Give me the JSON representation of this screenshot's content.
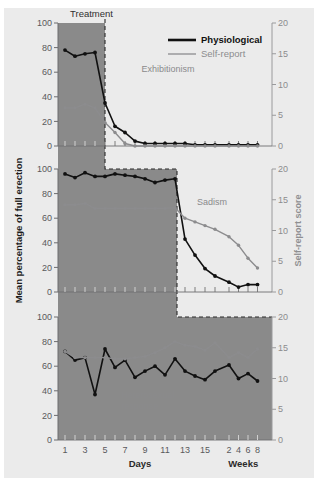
{
  "figure": {
    "background_color": "#ffffff",
    "panel_background_color": "#ebebeb",
    "shading_color": "#8a8a8a",
    "series_colors": {
      "physiological": "#111111",
      "self_report": "#8c8c8e"
    }
  },
  "axes": {
    "left_title": "Mean percentage of full erection",
    "right_title": "Self-report score",
    "x_title_days": "Days",
    "x_title_weeks": "Weeks",
    "left_ticks": [
      "0",
      "20",
      "40",
      "60",
      "80",
      "100"
    ],
    "right_ticks": [
      "0",
      "5",
      "10",
      "15",
      "20"
    ],
    "x_day_ticks": [
      "1",
      "3",
      "5",
      "7",
      "9",
      "11",
      "13",
      "15"
    ],
    "x_week_ticks": [
      "2",
      "4",
      "6",
      "8"
    ],
    "left_range": [
      0,
      100
    ],
    "right_range": [
      0,
      20
    ]
  },
  "legend": {
    "position": "top-right",
    "entries": [
      {
        "label": "Physiological",
        "color": "#111111",
        "style": "thick-solid"
      },
      {
        "label": "Self-report",
        "color": "#8c8c8e",
        "style": "thin-solid"
      }
    ]
  },
  "phase": {
    "treatment_label": "Treatment"
  },
  "panels": [
    {
      "annotation": "Exhibitionism"
    },
    {
      "annotation": "Sadism"
    },
    {
      "annotation": "Heterosexual response"
    }
  ],
  "chart_data": [
    {
      "type": "line",
      "title": "Exhibitionism",
      "xlabel": "Days / Weeks",
      "ylabel": "Mean percentage of full erection",
      "ylabel_right": "Self-report score",
      "ylim": [
        0,
        100
      ],
      "ylim_right": [
        0,
        20
      ],
      "grid": false,
      "legend": [
        "Physiological",
        "Self-report"
      ],
      "treatment_shading_x": [
        1,
        5
      ],
      "x": [
        1,
        2,
        3,
        4,
        5,
        6,
        7,
        8,
        9,
        10,
        11,
        12,
        13,
        14,
        15,
        16,
        "w2",
        "w4",
        "w6",
        "w8"
      ],
      "series": [
        {
          "name": "Physiological",
          "axis": "left",
          "values": [
            78,
            73,
            75,
            76,
            35,
            16,
            11,
            4,
            2,
            2,
            2,
            2,
            2,
            1,
            1,
            1,
            1,
            1,
            1,
            1
          ]
        },
        {
          "name": "Self-report",
          "axis": "right",
          "values": [
            6.2,
            6.2,
            6.8,
            6.2,
            3.8,
            2.2,
            0.4,
            0,
            0,
            0,
            0,
            0,
            0,
            0,
            0,
            0,
            0,
            0,
            0,
            0
          ]
        }
      ]
    },
    {
      "type": "line",
      "title": "Sadism",
      "xlabel": "Days / Weeks",
      "ylabel": "Mean percentage of full erection",
      "ylabel_right": "Self-report score",
      "ylim": [
        0,
        100
      ],
      "ylim_right": [
        0,
        20
      ],
      "grid": false,
      "legend": [
        "Physiological",
        "Self-report"
      ],
      "treatment_shading_x": [
        1,
        11
      ],
      "x": [
        1,
        2,
        3,
        4,
        5,
        6,
        7,
        8,
        9,
        10,
        11,
        12,
        13,
        14,
        15,
        16,
        "w2",
        "w4",
        "w6",
        "w8"
      ],
      "series": [
        {
          "name": "Physiological",
          "axis": "left",
          "values": [
            96,
            93,
            97,
            94,
            94,
            96,
            95,
            94,
            92,
            89,
            91,
            92,
            43,
            30,
            19,
            13,
            8,
            4,
            6,
            6
          ],
          "note": "post-treatment from day 13 onward declines; weeks values 6,6,4,2"
        },
        {
          "name": "Self-report",
          "axis": "right",
          "values": [
            14.2,
            14.2,
            14.4,
            13.6,
            13.6,
            13.6,
            13.6,
            13.6,
            13.6,
            13.6,
            13.6,
            13.7,
            12.0,
            11.4,
            10.8,
            10.2,
            9.0,
            7.6,
            5.5,
            3.9
          ]
        }
      ]
    },
    {
      "type": "line",
      "title": "Heterosexual response",
      "xlabel": "Days / Weeks",
      "ylabel": "Mean percentage of full erection",
      "ylabel_right": "Self-report score",
      "ylim": [
        0,
        100
      ],
      "ylim_right": [
        0,
        20
      ],
      "grid": false,
      "legend": [
        "Physiological",
        "Self-report"
      ],
      "treatment_shading_x": [
        1,
        "w8"
      ],
      "x": [
        1,
        2,
        3,
        4,
        5,
        6,
        7,
        8,
        9,
        10,
        11,
        12,
        13,
        14,
        15,
        16,
        "w2",
        "w4",
        "w6",
        "w8"
      ],
      "series": [
        {
          "name": "Physiological",
          "axis": "left",
          "values": [
            72,
            65,
            67,
            37,
            74,
            59,
            65,
            51,
            56,
            60,
            53,
            66,
            56,
            52,
            49,
            56,
            61,
            50,
            54,
            48
          ]
        },
        {
          "name": "Self-report",
          "axis": "right",
          "values": [
            14.4,
            13.4,
            13.4,
            13.4,
            13.4,
            13.2,
            13.2,
            13.4,
            13.6,
            14.2,
            15.0,
            16.0,
            15.4,
            15.2,
            14.6,
            15.8,
            13.4,
            14.2,
            13.4,
            14.8
          ]
        }
      ]
    }
  ]
}
